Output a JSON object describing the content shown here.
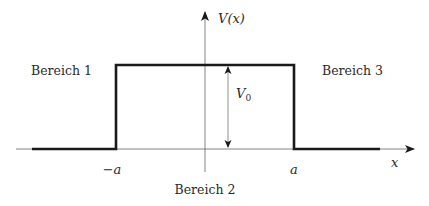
{
  "diagram": {
    "y_axis_label": "V(x)",
    "x_axis_label": "x",
    "barrier_height_label": "V",
    "barrier_height_subscript": "0",
    "left_edge_label": "−a",
    "right_edge_label": "a",
    "regions": [
      {
        "label": "Bereich 1"
      },
      {
        "label": "Bereich 2"
      },
      {
        "label": "Bereich 3"
      }
    ],
    "colors": {
      "potential_line": "#1a1a1a",
      "axes": "#555555",
      "text": "#2a2a2a"
    }
  }
}
